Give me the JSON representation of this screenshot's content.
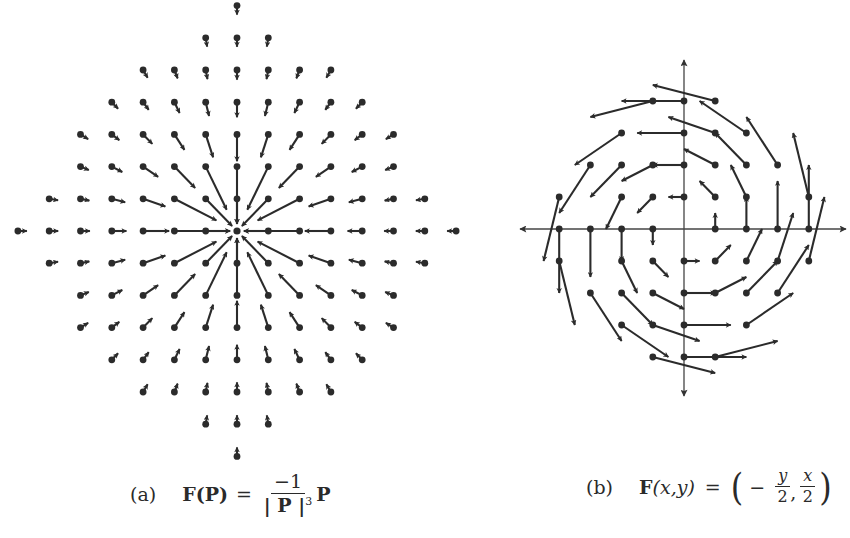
{
  "figure": {
    "panel_a": {
      "label": "(a)",
      "formula": {
        "lhs": "F(P)",
        "equals": "=",
        "numerator": "−1",
        "denominator_core": "| P |",
        "denominator_exp": "3",
        "rhs_tail": "P"
      }
    },
    "panel_b": {
      "label": "(b)",
      "formula": {
        "lhs_F": "F",
        "lhs_args": "(x,y)",
        "equals": "=",
        "open": "(",
        "minus": "−",
        "frac1_num": "y",
        "frac1_den": "2",
        "comma": ",",
        "frac2_num": "x",
        "frac2_den": "2",
        "close": ")"
      }
    }
  },
  "chart_data": [
    {
      "type": "vector_field",
      "title": "(a) F(P) = −1/|P|^3 P",
      "field": "F(P) = -P/|P|^3",
      "description": "Inverse-square radial field pointing toward origin; arrows drawn at tail points on integer grid within a diamond-shaped region",
      "origin_px": [
        237,
        231
      ],
      "unit_px": [
        31.3,
        32.2
      ],
      "arrow_scale": 7.5,
      "axes_visible": false,
      "color": "#2b2b2b",
      "rows": [
        {
          "y": 7,
          "x_range": [
            0,
            0
          ]
        },
        {
          "y": 6,
          "x_range": [
            -1,
            1
          ]
        },
        {
          "y": 5,
          "x_range": [
            -3,
            3
          ]
        },
        {
          "y": 4,
          "x_range": [
            -4,
            4
          ]
        },
        {
          "y": 3,
          "x_range": [
            -5,
            5
          ]
        },
        {
          "y": 2,
          "x_range": [
            -5,
            5
          ]
        },
        {
          "y": 1,
          "x_range": [
            -6,
            6
          ]
        },
        {
          "y": 0,
          "x_range": [
            -7,
            7
          ]
        },
        {
          "y": -1,
          "x_range": [
            -6,
            6
          ]
        },
        {
          "y": -2,
          "x_range": [
            -5,
            5
          ]
        },
        {
          "y": -3,
          "x_range": [
            -5,
            5
          ]
        },
        {
          "y": -4,
          "x_range": [
            -4,
            4
          ]
        },
        {
          "y": -5,
          "x_range": [
            -3,
            3
          ]
        },
        {
          "y": -6,
          "x_range": [
            -1,
            1
          ]
        },
        {
          "y": -7,
          "x_range": [
            0,
            0
          ]
        }
      ]
    },
    {
      "type": "vector_field",
      "title": "(b) F(x,y) = (−y/2, x/2)",
      "field": "F(x,y) = (-y/2, x/2)",
      "description": "Rotational (counterclockwise) field; arrows drawn at scale 1 from selected integer grid points",
      "origin_px": [
        684,
        229
      ],
      "unit_px": [
        31.2,
        32.0
      ],
      "arrow_scale": 1,
      "axes_visible": true,
      "axes_px": {
        "x_from": 520,
        "x_to": 846,
        "y_from": 60,
        "y_to": 396
      },
      "color": "#2b2b2b",
      "points": [
        [
          0,
          4
        ],
        [
          -1,
          4
        ],
        [
          1,
          4
        ],
        [
          0,
          3
        ],
        [
          -2,
          3
        ],
        [
          1,
          3
        ],
        [
          2,
          3
        ],
        [
          0,
          2
        ],
        [
          -1,
          2
        ],
        [
          -2,
          2
        ],
        [
          -3,
          2
        ],
        [
          1,
          2
        ],
        [
          2,
          2
        ],
        [
          3,
          2
        ],
        [
          0,
          1
        ],
        [
          -1,
          1
        ],
        [
          -2,
          1
        ],
        [
          -4,
          1
        ],
        [
          1,
          1
        ],
        [
          2,
          1
        ],
        [
          4,
          1
        ],
        [
          -4,
          0
        ],
        [
          -3,
          0
        ],
        [
          -2,
          0
        ],
        [
          -1,
          0
        ],
        [
          1,
          0
        ],
        [
          2,
          0
        ],
        [
          3,
          0
        ],
        [
          4,
          0
        ],
        [
          0,
          -1
        ],
        [
          -1,
          -1
        ],
        [
          -2,
          -1
        ],
        [
          -4,
          -1
        ],
        [
          1,
          -1
        ],
        [
          2,
          -1
        ],
        [
          3,
          -1
        ],
        [
          4,
          -1
        ],
        [
          0,
          -2
        ],
        [
          -1,
          -2
        ],
        [
          -2,
          -2
        ],
        [
          -3,
          -2
        ],
        [
          1,
          -2
        ],
        [
          2,
          -2
        ],
        [
          3,
          -2
        ],
        [
          0,
          -3
        ],
        [
          -1,
          -3
        ],
        [
          -2,
          -3
        ],
        [
          2,
          -3
        ],
        [
          0,
          -4
        ],
        [
          -1,
          -4
        ],
        [
          1,
          -4
        ]
      ]
    }
  ]
}
